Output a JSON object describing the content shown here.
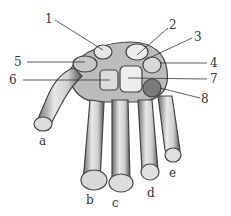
{
  "figure": {
    "numbered_labels": [
      {
        "id": "1",
        "text": "1",
        "x": 45,
        "y": 13
      },
      {
        "id": "2",
        "text": "2",
        "x": 169,
        "y": 19
      },
      {
        "id": "3",
        "text": "3",
        "x": 194,
        "y": 31
      },
      {
        "id": "4",
        "text": "4",
        "x": 210,
        "y": 57
      },
      {
        "id": "5",
        "text": "5",
        "x": 14,
        "y": 56
      },
      {
        "id": "6",
        "text": "6",
        "x": 9,
        "y": 74
      },
      {
        "id": "7",
        "text": "7",
        "x": 210,
        "y": 73
      },
      {
        "id": "8",
        "text": "8",
        "x": 201,
        "y": 93
      }
    ],
    "finger_labels": [
      {
        "id": "a",
        "text": "a",
        "x": 39,
        "y": 135
      },
      {
        "id": "b",
        "text": "b",
        "x": 86,
        "y": 194
      },
      {
        "id": "c",
        "text": "c",
        "x": 112,
        "y": 197
      },
      {
        "id": "d",
        "text": "d",
        "x": 147,
        "y": 187
      },
      {
        "id": "e",
        "text": "e",
        "x": 169,
        "y": 167
      }
    ]
  }
}
